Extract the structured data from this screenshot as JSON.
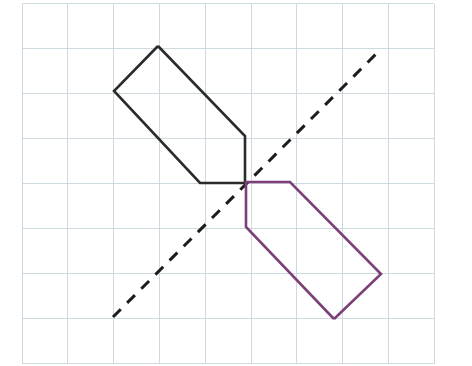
{
  "figure": {
    "background_color": "#ffffff",
    "width": 472,
    "height": 366
  },
  "grid": {
    "name": "graph-paper-grid",
    "line_color": "#c9d6dd",
    "line_width": 0.9,
    "x_start": 22,
    "x_spacing": 45.8,
    "x_count": 10,
    "y_start": 3.5,
    "y_spacing": 45.0,
    "y_count": 9,
    "x_positions": [
      22,
      67.8,
      113.6,
      159.4,
      205.2,
      251,
      296.8,
      342.6,
      388.4,
      434.2
    ],
    "y_positions": [
      3.5,
      48.5,
      93.5,
      138.5,
      183.5,
      228.5,
      273.5,
      318.5,
      363.5
    ]
  },
  "mirror_line": {
    "name": "line-of-reflection",
    "color": "#1c1c1c",
    "width": 3,
    "dash": "11 9",
    "x1": 113,
    "y1": 317,
    "x2": 379,
    "y2": 51,
    "style": "dashed"
  },
  "shapes": [
    {
      "id": "preimage",
      "label": "Original pentagon",
      "color": "#2b2b2b",
      "stroke_width": 2.6,
      "points": "158,46 114,91 200,183 245,183 245,136",
      "vertices": [
        {
          "x": 158,
          "y": 46
        },
        {
          "x": 114,
          "y": 91
        },
        {
          "x": 200,
          "y": 183
        },
        {
          "x": 245,
          "y": 183
        },
        {
          "x": 245,
          "y": 136
        }
      ]
    },
    {
      "id": "image",
      "label": "Reflected pentagon",
      "color": "#7c3f78",
      "stroke_width": 2.6,
      "points": "334,319 381,274 290,182 246,182 246,227",
      "vertices": [
        {
          "x": 334,
          "y": 319
        },
        {
          "x": 381,
          "y": 274
        },
        {
          "x": 290,
          "y": 182
        },
        {
          "x": 246,
          "y": 182
        },
        {
          "x": 246,
          "y": 227
        }
      ]
    }
  ]
}
